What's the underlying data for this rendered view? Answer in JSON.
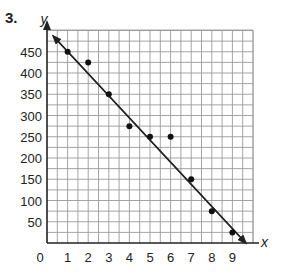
{
  "problem": {
    "number": "3."
  },
  "colors": {
    "grid": "#9a9a9a",
    "axis": "#222222",
    "point": "#111111",
    "line": "#222222"
  },
  "chart_data": {
    "type": "scatter",
    "title": "",
    "xlabel": "x",
    "ylabel": "y",
    "xlim": [
      0,
      9.5
    ],
    "ylim": [
      0,
      500
    ],
    "grid": true,
    "grid_minor_x": 0.5,
    "grid_minor_y": 25,
    "x_ticks": [
      "1",
      "2",
      "3",
      "4",
      "5",
      "6",
      "7",
      "8",
      "9"
    ],
    "y_ticks": [
      "50",
      "100",
      "150",
      "200",
      "250",
      "300",
      "350",
      "400",
      "450"
    ],
    "origin_label": "0",
    "points": [
      {
        "x": 1,
        "y": 450
      },
      {
        "x": 2,
        "y": 425
      },
      {
        "x": 3,
        "y": 350
      },
      {
        "x": 4,
        "y": 275
      },
      {
        "x": 5,
        "y": 250
      },
      {
        "x": 6,
        "y": 250
      },
      {
        "x": 7,
        "y": 150
      },
      {
        "x": 8,
        "y": 75
      },
      {
        "x": 9,
        "y": 25
      }
    ],
    "trend_line": {
      "x1": 0.3,
      "y1": 487,
      "x2": 9.65,
      "y2": 0,
      "arrows": "both"
    },
    "legend": null
  }
}
